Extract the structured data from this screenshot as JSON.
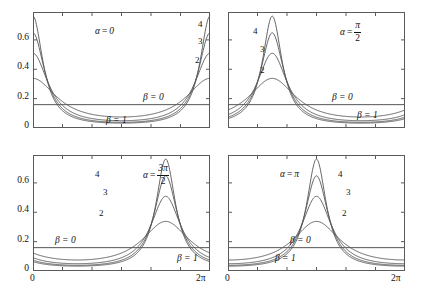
{
  "figure": {
    "axis": {
      "y_ticks": [
        "0",
        "0.2",
        "0.4",
        "0.6"
      ],
      "y_tick_values": [
        0,
        0.2,
        0.4,
        0.6
      ],
      "ylim": [
        0,
        0.79
      ],
      "x_ticks": [
        "0",
        "2π"
      ],
      "x_tick_values": [
        0,
        6.283185307179586
      ],
      "xlim": [
        0,
        6.283185307179586
      ],
      "n_minor_x_ticks": 6,
      "grid": false
    },
    "line_color": "#555555",
    "frame_color": "#5a5a5a"
  },
  "chart_data": [
    {
      "type": "line",
      "panel": "top-left",
      "title": "",
      "alpha_label": "α = 0",
      "alpha_value": 0,
      "alpha_display": {
        "symbol": "α",
        "eq": "=",
        "numerator": "0",
        "denominator": ""
      },
      "xlabel": "",
      "ylabel": "",
      "xlim": [
        0,
        6.283185307179586
      ],
      "ylim": [
        0,
        0.79
      ],
      "xticks": [
        0,
        6.283185307179586
      ],
      "xticklabels": [
        "0",
        "2π"
      ],
      "yticks": [
        0,
        0.2,
        0.4,
        0.6
      ],
      "yticklabels": [
        "0",
        "0.2",
        "0.4",
        "0.6"
      ],
      "annotations": [
        {
          "text": "β = 0",
          "x": 4.55,
          "y": 0.245
        },
        {
          "text": "β = 1",
          "x": 3.05,
          "y": 0.085
        }
      ],
      "series": [
        {
          "name": "β = 1",
          "beta": 1,
          "peak_value": 0.338,
          "peak_x": 0.0,
          "min_value": 0.06
        },
        {
          "name": "2",
          "beta": 2,
          "peak_value": 0.509,
          "peak_x": 0.0,
          "min_value": 0.021
        },
        {
          "name": "3",
          "beta": 3,
          "peak_value": 0.648,
          "peak_x": 0.0,
          "min_value": 0.008
        },
        {
          "name": "4",
          "beta": 4,
          "peak_value": 0.762,
          "peak_x": 0.0,
          "min_value": 0.003
        },
        {
          "name": "β = 0",
          "beta": 0,
          "peak_value": 0.159,
          "peak_x": 0.0,
          "min_value": 0.159
        }
      ],
      "curve_labels": [
        {
          "text": "4",
          "x": 5.93,
          "y": 0.7
        },
        {
          "text": "3",
          "x": 5.93,
          "y": 0.58
        },
        {
          "text": "2",
          "x": 5.88,
          "y": 0.45
        }
      ]
    },
    {
      "type": "line",
      "panel": "top-right",
      "title": "",
      "alpha_label": "α = π/2",
      "alpha_value": 1.5707963267948966,
      "alpha_display": {
        "symbol": "α",
        "eq": "=",
        "numerator": "π",
        "denominator": "2"
      },
      "xlabel": "",
      "ylabel": "",
      "xlim": [
        0,
        6.283185307179586
      ],
      "ylim": [
        0,
        0.79
      ],
      "xticks": [
        0,
        6.283185307179586
      ],
      "xticklabels": [
        "0",
        "2π"
      ],
      "yticks": [
        0,
        0.2,
        0.4,
        0.6
      ],
      "yticklabels": [
        "0",
        "0.2",
        "0.4",
        "0.6"
      ],
      "annotations": [
        {
          "text": "β = 0",
          "x": 4.3,
          "y": 0.245
        },
        {
          "text": "β = 1",
          "x": 5.2,
          "y": 0.115
        }
      ],
      "series": [
        {
          "name": "β = 1",
          "beta": 1,
          "peak_value": 0.338,
          "peak_x": 1.5707963267948966,
          "min_value": 0.06
        },
        {
          "name": "2",
          "beta": 2,
          "peak_value": 0.509,
          "peak_x": 1.5707963267948966,
          "min_value": 0.021
        },
        {
          "name": "3",
          "beta": 3,
          "peak_value": 0.648,
          "peak_x": 1.5707963267948966,
          "min_value": 0.008
        },
        {
          "name": "4",
          "beta": 4,
          "peak_value": 0.762,
          "peak_x": 1.5707963267948966,
          "min_value": 0.003
        },
        {
          "name": "β = 0",
          "beta": 0,
          "peak_value": 0.159,
          "peak_x": 0.0,
          "min_value": 0.159
        }
      ],
      "curve_labels": [
        {
          "text": "4",
          "x": 1.1,
          "y": 0.665
        },
        {
          "text": "3",
          "x": 1.16,
          "y": 0.545
        },
        {
          "text": "2",
          "x": 1.16,
          "y": 0.405
        }
      ]
    },
    {
      "type": "line",
      "panel": "bottom-left",
      "title": "",
      "alpha_label": "α = 3π/2",
      "alpha_value": 4.71238898038469,
      "alpha_display": {
        "symbol": "α",
        "eq": "=",
        "numerator": "3π",
        "denominator": "2"
      },
      "xlabel": "",
      "ylabel": "",
      "xlim": [
        0,
        6.283185307179586
      ],
      "ylim": [
        0,
        0.79
      ],
      "xticks": [
        0,
        6.283185307179586
      ],
      "xticklabels": [
        "0",
        "2π"
      ],
      "yticks": [
        0,
        0.2,
        0.4,
        0.6
      ],
      "yticklabels": [
        "0",
        "0.2",
        "0.4",
        "0.6"
      ],
      "annotations": [
        {
          "text": "β = 0",
          "x": 1.05,
          "y": 0.245
        },
        {
          "text": "β = 1",
          "x": 5.45,
          "y": 0.115
        }
      ],
      "series": [
        {
          "name": "β = 1",
          "beta": 1,
          "peak_value": 0.338,
          "peak_x": 3.141592653589793,
          "min_value": 0.06
        },
        {
          "name": "2",
          "beta": 2,
          "peak_value": 0.509,
          "peak_x": 3.141592653589793,
          "min_value": 0.021
        },
        {
          "name": "3",
          "beta": 3,
          "peak_value": 0.648,
          "peak_x": 3.141592653589793,
          "min_value": 0.008
        },
        {
          "name": "4",
          "beta": 4,
          "peak_value": 0.762,
          "peak_x": 3.141592653589793,
          "min_value": 0.003
        },
        {
          "name": "β = 0",
          "beta": 0,
          "peak_value": 0.159,
          "peak_x": 0.0,
          "min_value": 0.159
        }
      ],
      "curve_labels": [
        {
          "text": "4",
          "x": 2.62,
          "y": 0.665
        },
        {
          "text": "3",
          "x": 2.72,
          "y": 0.545
        },
        {
          "text": "2",
          "x": 2.68,
          "y": 0.405
        }
      ]
    },
    {
      "type": "line",
      "panel": "bottom-right",
      "title": "",
      "alpha_label": "α = π",
      "alpha_value": 3.141592653589793,
      "alpha_display": {
        "symbol": "α",
        "eq": "=",
        "numerator": "π",
        "denominator": ""
      },
      "xlabel": "",
      "ylabel": "",
      "xlim": [
        0,
        6.283185307179586
      ],
      "ylim": [
        0,
        0.79
      ],
      "xticks": [
        0,
        6.283185307179586
      ],
      "xticklabels": [
        "0",
        "2π"
      ],
      "yticks": [
        0,
        0.2,
        0.4,
        0.6
      ],
      "yticklabels": [
        "0",
        "0.2",
        "0.4",
        "0.6"
      ],
      "annotations": [
        {
          "text": "β = 0",
          "x": 2.05,
          "y": 0.245
        },
        {
          "text": "β = 1",
          "x": 1.55,
          "y": 0.115
        }
      ],
      "series": [
        {
          "name": "β = 1",
          "beta": 1,
          "peak_value": 0.338,
          "peak_x": 4.71238898038469,
          "min_value": 0.06
        },
        {
          "name": "2",
          "beta": 2,
          "peak_value": 0.509,
          "peak_x": 4.71238898038469,
          "min_value": 0.021
        },
        {
          "name": "3",
          "beta": 3,
          "peak_value": 0.648,
          "peak_x": 4.71238898038469,
          "min_value": 0.008
        },
        {
          "name": "4",
          "beta": 4,
          "peak_value": 0.762,
          "peak_x": 4.71238898038469,
          "min_value": 0.003
        },
        {
          "name": "β = 0",
          "beta": 0,
          "peak_value": 0.159,
          "peak_x": 0.0,
          "min_value": 0.159
        }
      ],
      "curve_labels": [
        {
          "text": "4",
          "x": 4.25,
          "y": 0.665
        },
        {
          "text": "3",
          "x": 4.34,
          "y": 0.545
        },
        {
          "text": "2",
          "x": 4.28,
          "y": 0.405
        }
      ]
    }
  ]
}
